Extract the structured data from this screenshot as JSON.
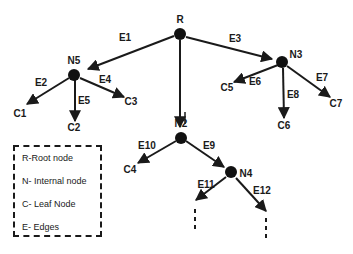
{
  "diagram": {
    "type": "tree",
    "nodes": [
      {
        "id": "R",
        "label": "R",
        "kind": "root",
        "x": 180,
        "y": 34,
        "lx": 180,
        "ly": 23
      },
      {
        "id": "N5",
        "label": "N5",
        "kind": "internal",
        "x": 74,
        "y": 75,
        "lx": 74,
        "ly": 64
      },
      {
        "id": "N3",
        "label": "N3",
        "kind": "internal",
        "x": 282,
        "y": 62,
        "lx": 296,
        "ly": 58
      },
      {
        "id": "N2",
        "label": "N2",
        "kind": "internal",
        "x": 181,
        "y": 138,
        "lx": 181,
        "ly": 127
      },
      {
        "id": "N4",
        "label": "N4",
        "kind": "internal",
        "x": 231,
        "y": 172,
        "lx": 246,
        "ly": 177
      },
      {
        "id": "C1",
        "label": "C1",
        "kind": "leaf",
        "lx": 20,
        "ly": 117
      },
      {
        "id": "C2",
        "label": "C2",
        "kind": "leaf",
        "lx": 74,
        "ly": 131
      },
      {
        "id": "C3",
        "label": "C3",
        "kind": "leaf",
        "lx": 131,
        "ly": 105
      },
      {
        "id": "C5",
        "label": "C5",
        "kind": "leaf",
        "lx": 227,
        "ly": 91
      },
      {
        "id": "C6",
        "label": "C6",
        "kind": "leaf",
        "lx": 284,
        "ly": 129
      },
      {
        "id": "C7",
        "label": "C7",
        "kind": "leaf",
        "lx": 336,
        "ly": 107
      },
      {
        "id": "C4",
        "label": "C4",
        "kind": "leaf",
        "lx": 130,
        "ly": 173
      }
    ],
    "edges": [
      {
        "label": "E1",
        "from": "R",
        "to": "N5",
        "x1": 174,
        "y1": 36,
        "x2": 88,
        "y2": 69,
        "lx": 125,
        "ly": 41
      },
      {
        "label": "E3",
        "from": "R",
        "to": "N3",
        "x1": 186,
        "y1": 37,
        "x2": 272,
        "y2": 59,
        "lx": 235,
        "ly": 42
      },
      {
        "label": "E2",
        "from": "N5",
        "to": "C1",
        "x1": 69,
        "y1": 78,
        "x2": 27,
        "y2": 104,
        "lx": 41,
        "ly": 86
      },
      {
        "label": "E5",
        "from": "N5",
        "to": "C2",
        "x1": 75,
        "y1": 80,
        "x2": 75,
        "y2": 121,
        "lx": 84,
        "ly": 104
      },
      {
        "label": "E4",
        "from": "N5",
        "to": "C3",
        "x1": 80,
        "y1": 78,
        "x2": 124,
        "y2": 97,
        "lx": 105,
        "ly": 83
      },
      {
        "label": "E6",
        "from": "N3",
        "to": "C5",
        "x1": 278,
        "y1": 65,
        "x2": 234,
        "y2": 82,
        "lx": 255,
        "ly": 85
      },
      {
        "label": "E8",
        "from": "N3",
        "to": "C6",
        "x1": 283,
        "y1": 68,
        "x2": 284,
        "y2": 118,
        "lx": 293,
        "ly": 98
      },
      {
        "label": "E7",
        "from": "N3",
        "to": "C7",
        "x1": 287,
        "y1": 66,
        "x2": 330,
        "y2": 97,
        "lx": 322,
        "ly": 81
      },
      {
        "label": "E10",
        "from": "N2",
        "to": "C4",
        "x1": 176,
        "y1": 141,
        "x2": 138,
        "y2": 163,
        "lx": 147,
        "ly": 149
      },
      {
        "label": "E9",
        "from": "N2",
        "to": "N4",
        "x1": 186,
        "y1": 141,
        "x2": 224,
        "y2": 167,
        "lx": 209,
        "ly": 149
      },
      {
        "label": "E11",
        "from": "N4",
        "to": "ellipsis-left",
        "x1": 226,
        "y1": 177,
        "x2": 196,
        "y2": 200,
        "lx": 206,
        "ly": 188
      },
      {
        "label": "E12",
        "from": "N4",
        "to": "ellipsis-right",
        "x1": 236,
        "y1": 178,
        "x2": 266,
        "y2": 211,
        "lx": 262,
        "ly": 194
      }
    ],
    "root_edge_to_n2": {
      "from": "R",
      "to": "N2",
      "x1": 180,
      "y1": 40,
      "x2": 180,
      "y2": 127,
      "tick_x": 185,
      "tick_y1": 112,
      "tick_y2": 124
    },
    "continuation_marks": [
      {
        "x": 195,
        "y1": 209,
        "y2": 232
      },
      {
        "x": 266,
        "y1": 218,
        "y2": 240
      }
    ],
    "node_radius": 6,
    "stroke_color": "#1a1a1a"
  },
  "legend": {
    "items": [
      {
        "label": "R-Root node"
      },
      {
        "label": "N- Internal node"
      },
      {
        "label": "C- Leaf Node"
      },
      {
        "label": "E- Edges"
      }
    ]
  }
}
